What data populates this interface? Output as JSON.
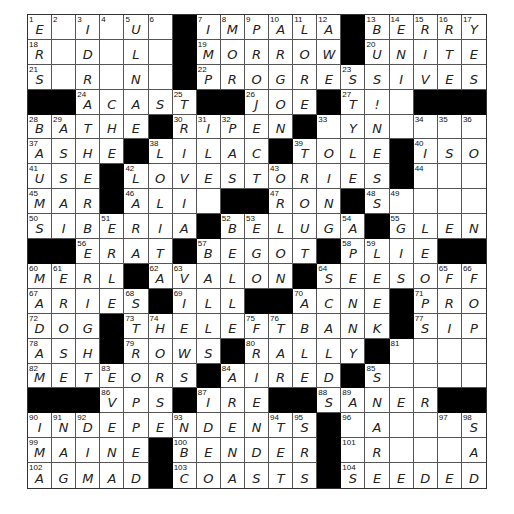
{
  "puzzle": {
    "rows": 19,
    "cols": 19,
    "grid": [
      [
        "1:E",
        "2:",
        "3:I",
        "4:",
        "5:U",
        "6:",
        "#",
        "7:I",
        "8:M",
        "9:P",
        "10:A",
        "11:L",
        "12:A",
        "#",
        "13:B",
        "14:E",
        "15:R",
        "16:R",
        "17:Y"
      ],
      [
        "18:R",
        ":",
        ":D",
        ":",
        ":L",
        ":",
        "#",
        "19:M",
        ":O",
        ":R",
        ":R",
        ":O",
        ":W",
        "#",
        "20:U",
        ":N",
        ":I",
        ":T",
        ":E"
      ],
      [
        "21:S",
        ":",
        ":R",
        ":",
        ":N",
        ":",
        "#",
        "22:P",
        ":R",
        ":O",
        ":G",
        ":R",
        ":E",
        "23:S",
        ":S",
        ":I",
        ":V",
        ":E",
        ":S"
      ],
      [
        "#",
        "#",
        "24:A",
        ":C",
        ":A",
        ":S",
        "25:T",
        "#",
        "#",
        "26:J",
        ":O",
        ":E",
        "#",
        "27:T",
        ":!",
        ":",
        "#",
        "#",
        "#"
      ],
      [
        "28:B",
        "29:A",
        ":T",
        ":H",
        ":E",
        "#",
        "30:R",
        "31:I",
        "32:P",
        ":E",
        ":N",
        "#",
        "33:",
        ":Y",
        ":N",
        ":",
        "34:",
        "35:",
        "36:"
      ],
      [
        "37:A",
        ":S",
        ":H",
        ":E",
        "#",
        "38:L",
        ":I",
        ":L",
        ":A",
        ":C",
        "#",
        "39:T",
        ":O",
        ":L",
        ":E",
        "#",
        "40:I",
        ":S",
        ":O"
      ],
      [
        "41:U",
        ":S",
        ":E",
        "#",
        "42:L",
        ":O",
        ":V",
        ":E",
        ":S",
        ":T",
        "43:O",
        ":R",
        ":I",
        ":E",
        ":S",
        "#",
        "44:",
        ":",
        ":"
      ],
      [
        "45:M",
        ":A",
        ":R",
        "#",
        "46:A",
        ":L",
        ":I",
        ":",
        "#",
        "#",
        "47:R",
        ":O",
        ":N",
        "#",
        "48:S",
        "49:",
        ":",
        ":",
        ":"
      ],
      [
        "50:S",
        ":I",
        ":B",
        "51:E",
        ":R",
        ":I",
        ":A",
        "#",
        "52:B",
        "53:E",
        ":L",
        ":U",
        ":G",
        "54:A",
        "#",
        "55:G",
        ":L",
        ":E",
        ":N"
      ],
      [
        "#",
        "#",
        "56:E",
        ":R",
        ":A",
        ":T",
        "#",
        "57:B",
        ":E",
        ":G",
        ":O",
        ":T",
        "#",
        "58:P",
        "59:L",
        ":I",
        ":E",
        "#",
        "#"
      ],
      [
        "60:M",
        "61:E",
        ":R",
        ":L",
        "#",
        "62:A",
        "63:V",
        ":A",
        ":L",
        ":O",
        ":N",
        "#",
        "64:S",
        ":E",
        ":E",
        ":S",
        ":O",
        "65:F",
        "66:F"
      ],
      [
        "67:A",
        ":R",
        ":I",
        ":E",
        "68:S",
        "#",
        "69:I",
        ":L",
        ":L",
        "#",
        "#",
        "70:A",
        ":C",
        ":N",
        ":E",
        "#",
        "71:P",
        ":R",
        ":O"
      ],
      [
        "72:D",
        ":O",
        ":G",
        "#",
        "73:T",
        "74:H",
        ":E",
        ":L",
        ":E",
        "75:F",
        "76:T",
        ":B",
        ":A",
        ":N",
        ":K",
        "#",
        "77:S",
        ":I",
        ":P"
      ],
      [
        "78:A",
        ":S",
        ":H",
        "#",
        "79:R",
        ":O",
        ":W",
        ":S",
        "#",
        "80:R",
        ":A",
        ":L",
        ":L",
        ":Y",
        "#",
        "81:",
        ":",
        ":",
        ":"
      ],
      [
        "82:M",
        ":E",
        ":T",
        "83:E",
        ":O",
        ":R",
        ":S",
        "#",
        "84:A",
        ":I",
        ":R",
        ":E",
        ":D",
        "#",
        "85:S",
        ":",
        ":",
        ":",
        ":"
      ],
      [
        "#",
        "#",
        "#",
        "86:V",
        ":P",
        ":S",
        "#",
        "87:I",
        ":R",
        ":E",
        "#",
        "#",
        "88:S",
        "89:A",
        ":N",
        ":E",
        ":R",
        "#",
        "#"
      ],
      [
        "90:I",
        "91:N",
        "92:D",
        ":E",
        ":P",
        ":E",
        "93:N",
        ":D",
        ":E",
        ":N",
        "94:T",
        "95:S",
        "#",
        "96:",
        ":A",
        ":",
        ":",
        "97:",
        "98:S"
      ],
      [
        "99:M",
        ":A",
        ":I",
        ":N",
        ":E",
        "#",
        "100:B",
        ":E",
        ":N",
        ":D",
        ":E",
        ":R",
        "#",
        "101:",
        ":R",
        ":",
        ":",
        ":",
        ":A"
      ],
      [
        "102:A",
        ":G",
        ":M",
        ":A",
        ":D",
        "#",
        "103:C",
        ":O",
        ":A",
        ":S",
        ":T",
        ":S",
        "#",
        "104:S",
        ":E",
        ":E",
        ":D",
        ":E",
        ":D"
      ]
    ]
  }
}
